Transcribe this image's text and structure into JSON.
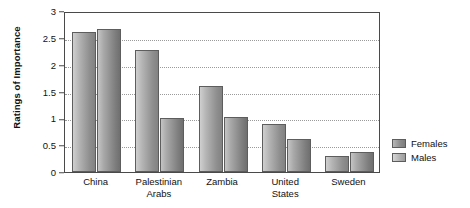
{
  "chart_data": {
    "type": "bar",
    "title": "",
    "xlabel": "",
    "ylabel": "Ratings of Importance",
    "categories": [
      "China",
      "Palestinian\nArabs",
      "Zambia",
      "United\nStates",
      "Sweden"
    ],
    "series": [
      {
        "name": "Females",
        "values": [
          2.6,
          2.27,
          1.6,
          0.9,
          0.3
        ]
      },
      {
        "name": "Males",
        "values": [
          2.67,
          1.0,
          1.03,
          0.62,
          0.38
        ]
      }
    ],
    "ylim": [
      0,
      3
    ],
    "yticks": [
      "0",
      "0.5",
      "1",
      "1.5",
      "2",
      "2.5",
      "3"
    ],
    "ytick_values": [
      0,
      0.5,
      1,
      1.5,
      2,
      2.5,
      3
    ],
    "grid": true,
    "grid_style": "dotted-horizontal",
    "legend_position": "right",
    "colors": {
      "females": "#8f8f8f",
      "males": "#a9a9a9",
      "axis": "#4a4a4a",
      "grid": "#9a9a9a",
      "text": "#111111",
      "background": "#ffffff"
    }
  }
}
